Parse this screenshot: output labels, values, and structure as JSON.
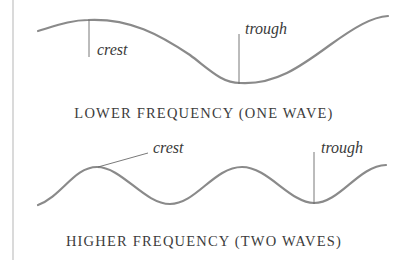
{
  "diagram": {
    "type": "wave-frequency-comparison",
    "colors": {
      "wave": "#8a8a8a",
      "pointer_line": "#6a6a6a",
      "text": "#3a3a3a",
      "margin_rule": "#b0b0b0"
    },
    "panels": [
      {
        "id": "lower",
        "caption": "LOWER FREQUENCY (ONE WAVE)",
        "wave_count": 1,
        "labels": {
          "crest": "crest",
          "trough": "trough"
        },
        "wave_path": "M38,31 C58,25 72,20 88,20 C130,18 160,35 190,55 C210,70 222,83 240,83 C275,85 300,67 330,45 C355,27 372,17 388,16"
      },
      {
        "id": "higher",
        "caption": "HIGHER FREQUENCY (TWO WAVES)",
        "wave_count": 2,
        "labels": {
          "crest": "crest",
          "trough": "trough"
        },
        "wave_path": "M38,205 C62,196 74,167 97,167 C122,167 144,204 170,204 C196,204 214,167 242,167 C268,167 290,203 314,203 C340,203 358,166 386,165"
      }
    ]
  }
}
